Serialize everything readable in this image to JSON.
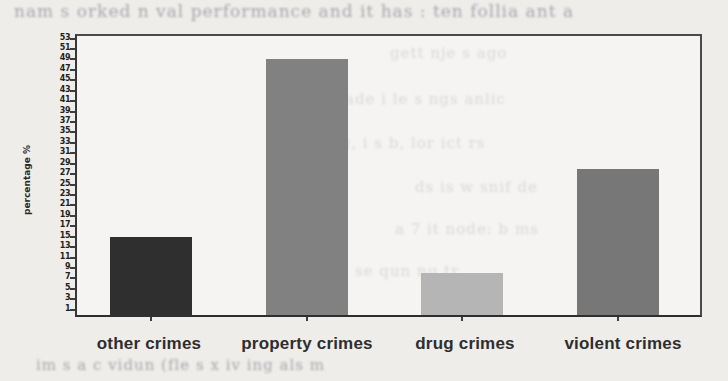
{
  "chart_data": {
    "type": "bar",
    "categories": [
      "other crimes",
      "property crimes",
      "drug crimes",
      "violent crimes"
    ],
    "values": [
      15,
      49,
      8,
      28
    ],
    "title": "",
    "xlabel": "",
    "ylabel": "percentage %",
    "ylim": [
      0,
      53.5
    ],
    "yticks": [
      1,
      3,
      5,
      7,
      9,
      11,
      13,
      15,
      17,
      19,
      21,
      23,
      25,
      27,
      29,
      31,
      33,
      35,
      37,
      39,
      41,
      43,
      45,
      47,
      49,
      51,
      53
    ],
    "grid": false,
    "legend": "none",
    "bar_colors": [
      "#2f2f2f",
      "#818181",
      "#b5b5b5",
      "#777777"
    ],
    "frame_color": "#4a4a4a",
    "bar_width_px": 82
  },
  "page": {
    "background_color": "#eeedea",
    "plot_background_color": "#faf9f6"
  },
  "background_bleed": {
    "note": "illegible mirrored print bleed-through from reverse page of scanned book",
    "lines": [
      {
        "x": 14,
        "y": 1,
        "size": 17,
        "text": "nam s orked n val performance and it has : ten follia ant a"
      },
      {
        "x": 390,
        "y": 44,
        "size": 15,
        "text": "gett  nje  s ago"
      },
      {
        "x": 345,
        "y": 90,
        "size": 15,
        "text": "ade i le s ngs   anlic"
      },
      {
        "x": 330,
        "y": 134,
        "size": 15,
        "text": "gg, i s b, lor ict  rs"
      },
      {
        "x": 415,
        "y": 178,
        "size": 15,
        "text": "ds is w  snif  de"
      },
      {
        "x": 395,
        "y": 220,
        "size": 15,
        "text": "a 7 it node: b  ms"
      },
      {
        "x": 355,
        "y": 262,
        "size": 15,
        "text": "se  qun  nu  tr"
      },
      {
        "x": 36,
        "y": 356,
        "size": 15,
        "text": "im s a c vidun (fle   s x iv ing als   m"
      }
    ]
  }
}
